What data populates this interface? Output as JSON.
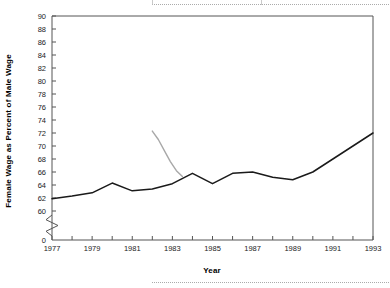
{
  "chart_data": {
    "type": "line",
    "title": "",
    "xlabel": "Year",
    "ylabel": "Female Wage as Percent of Male Wage",
    "xlim": [
      1977,
      1993
    ],
    "ylim": [
      60,
      90
    ],
    "y_axis_break": true,
    "y_axis_break_label": "0",
    "grid": false,
    "legend_position": "none",
    "x_tick_labels": [
      "1977",
      "1979",
      "1981",
      "1983",
      "1985",
      "1987",
      "1989",
      "1991",
      "1993"
    ],
    "x_tick_values": [
      1977,
      1979,
      1981,
      1983,
      1985,
      1987,
      1989,
      1991,
      1993
    ],
    "x_minor_tick_values": [
      1978,
      1980,
      1982,
      1984,
      1986,
      1988,
      1990,
      1992
    ],
    "y_tick_labels": [
      "60",
      "62",
      "64",
      "66",
      "68",
      "70",
      "72",
      "74",
      "76",
      "78",
      "80",
      "82",
      "84",
      "86",
      "88",
      "90"
    ],
    "y_tick_values": [
      60,
      62,
      64,
      66,
      68,
      70,
      72,
      74,
      76,
      78,
      80,
      82,
      84,
      86,
      88,
      90
    ],
    "series": [
      {
        "name": "primary-series",
        "color": "#1a1a1a",
        "x": [
          1977,
          1978,
          1979,
          1980,
          1981,
          1982,
          1983,
          1984,
          1985,
          1986,
          1987,
          1988,
          1989,
          1990,
          1991,
          1992,
          1993
        ],
        "values": [
          61.9,
          62.3,
          62.8,
          64.3,
          63.1,
          63.4,
          64.2,
          65.8,
          64.2,
          65.8,
          66.0,
          65.2,
          64.8,
          66.0,
          68.0,
          70.0,
          72.0
        ]
      },
      {
        "name": "secondary-series",
        "color": "#a8a8a8",
        "x": [
          1982.0,
          1982.3,
          1982.6,
          1982.9,
          1983.2,
          1983.5
        ],
        "values": [
          72.3,
          71.0,
          69.3,
          67.6,
          66.2,
          65.3
        ]
      }
    ]
  },
  "axes": {
    "y_title": "Female Wage as Percent of Male Wage",
    "x_title": "Year"
  },
  "colors": {
    "primary_line": "#1a1a1a",
    "secondary_line": "#a8a8a8",
    "frame": "#555555",
    "background": "#ffffff"
  }
}
